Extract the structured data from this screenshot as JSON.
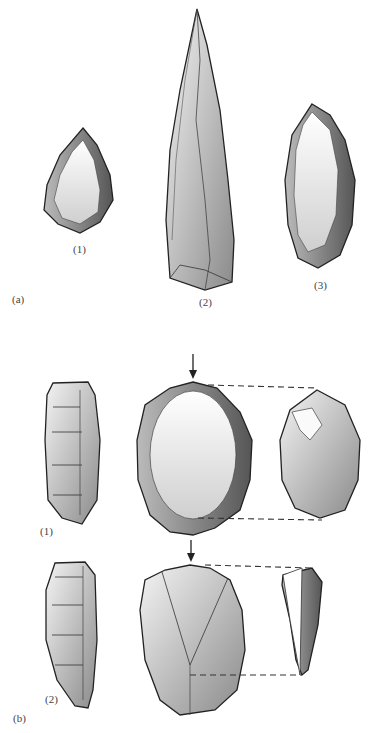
{
  "figure": {
    "panels": [
      {
        "id": "a",
        "label": "(a)",
        "items": [
          {
            "label": "(1)",
            "description": "small pointed flake tool with retouched edges"
          },
          {
            "label": "(2)",
            "description": "elongated blade point"
          },
          {
            "label": "(3)",
            "description": "oval side-scraper with retouched edges"
          }
        ]
      },
      {
        "id": "b",
        "label": "(b)",
        "items": [
          {
            "label": "(1)",
            "description": "prepared core, side view / face with arrow / flake removed (connected by dashed lines)"
          },
          {
            "label": "(2)",
            "description": "prepared core, side view / face with arrow / pointed flake removed (connected by dashed lines)"
          }
        ]
      }
    ]
  }
}
